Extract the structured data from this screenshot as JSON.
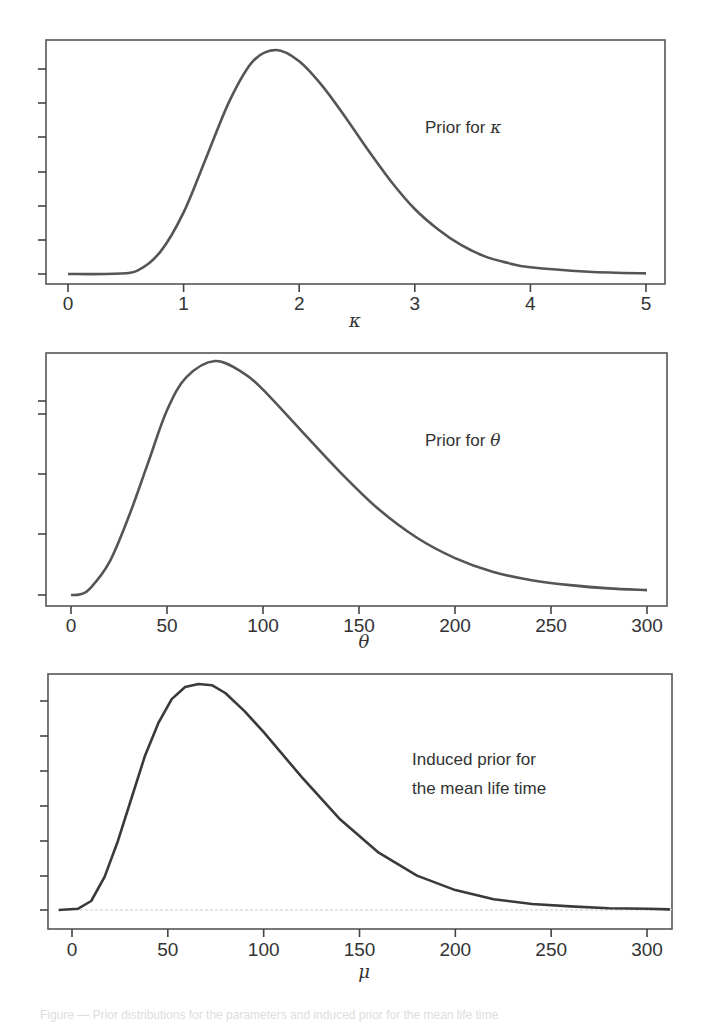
{
  "chart_data": [
    {
      "type": "line",
      "title": "",
      "annotation": {
        "text": "Prior for ",
        "symbol": "κ"
      },
      "xlabel": "κ",
      "ylabel": "",
      "xlim": [
        -0.2,
        5.2
      ],
      "xticks": [
        "0",
        "1",
        "2",
        "3",
        "4",
        "5"
      ],
      "yticks_labeled": false,
      "ytick_count": 7,
      "grid": false,
      "x": [
        0,
        0.4,
        0.6,
        0.8,
        1.0,
        1.2,
        1.4,
        1.6,
        1.8,
        2.0,
        2.2,
        2.4,
        2.6,
        2.8,
        3.0,
        3.2,
        3.4,
        3.6,
        3.8,
        4.0,
        4.5,
        5.0
      ],
      "values": [
        0,
        0.002,
        0.03,
        0.2,
        0.55,
        1.05,
        1.55,
        1.9,
        2.0,
        1.9,
        1.68,
        1.4,
        1.1,
        0.82,
        0.58,
        0.4,
        0.26,
        0.16,
        0.1,
        0.06,
        0.02,
        0.005
      ]
    },
    {
      "type": "line",
      "title": "",
      "annotation": {
        "text": "Prior for ",
        "symbol": "θ"
      },
      "xlabel": "θ",
      "ylabel": "",
      "xlim": [
        -10,
        312
      ],
      "xticks": [
        "0",
        "50",
        "100",
        "150",
        "200",
        "250",
        "300"
      ],
      "yticks_labeled": false,
      "ytick_count": 5,
      "grid": false,
      "x": [
        0,
        5,
        10,
        20,
        30,
        40,
        50,
        60,
        75,
        90,
        100,
        120,
        140,
        160,
        180,
        200,
        220,
        240,
        260,
        280,
        300
      ],
      "values": [
        0.0,
        0.01,
        0.08,
        0.4,
        0.95,
        1.6,
        2.25,
        2.65,
        2.85,
        2.7,
        2.5,
        2.0,
        1.5,
        1.05,
        0.7,
        0.45,
        0.28,
        0.18,
        0.12,
        0.08,
        0.06
      ]
    },
    {
      "type": "line",
      "title": "",
      "annotation": {
        "lines": [
          "Induced prior for",
          "the mean life time"
        ]
      },
      "xlabel": "μ",
      "ylabel": "",
      "xlim": [
        -12,
        312
      ],
      "xticks": [
        "0",
        "50",
        "100",
        "150",
        "200",
        "250",
        "300"
      ],
      "yticks_labeled": false,
      "ytick_count": 7,
      "grid": false,
      "x": [
        -7,
        3,
        10,
        17,
        24,
        31,
        38,
        45,
        52,
        59,
        66,
        73,
        80,
        90,
        100,
        120,
        140,
        160,
        180,
        200,
        220,
        240,
        260,
        280,
        300,
        312
      ],
      "values": [
        0,
        0.02,
        0.15,
        0.55,
        1.15,
        1.85,
        2.55,
        3.1,
        3.5,
        3.7,
        3.75,
        3.73,
        3.6,
        3.3,
        2.95,
        2.2,
        1.5,
        0.95,
        0.57,
        0.33,
        0.18,
        0.1,
        0.06,
        0.03,
        0.02,
        0.01
      ]
    }
  ],
  "caption": "Figure — Prior distributions for the parameters and induced prior for the mean life time"
}
